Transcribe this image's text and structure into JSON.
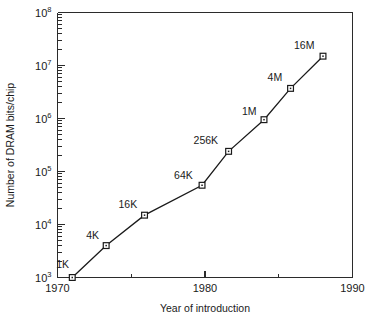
{
  "chart_data": {
    "type": "line",
    "title": "",
    "subtitle": "",
    "xlabel": "Year of introduction",
    "ylabel": "Number of DRAM bits/chip",
    "xlim": [
      1970,
      1990
    ],
    "ylim": [
      1000,
      100000000
    ],
    "yscale": "log",
    "xscale": "linear",
    "grid": false,
    "legend": "none",
    "x_ticks": [
      {
        "value": 1970,
        "label": "1970",
        "type": "major"
      },
      {
        "value": 1975,
        "label": "",
        "type": "minor"
      },
      {
        "value": 1980,
        "label": "1980",
        "type": "major"
      },
      {
        "value": 1985,
        "label": "",
        "type": "minor"
      },
      {
        "value": 1990,
        "label": "1990",
        "type": "major"
      }
    ],
    "y_ticks": [
      {
        "value": 1000,
        "mantissa": "10",
        "exponent": "3"
      },
      {
        "value": 10000,
        "mantissa": "10",
        "exponent": "4"
      },
      {
        "value": 100000,
        "mantissa": "10",
        "exponent": "5"
      },
      {
        "value": 1000000,
        "mantissa": "10",
        "exponent": "6"
      },
      {
        "value": 10000000,
        "mantissa": "10",
        "exponent": "7"
      },
      {
        "value": 100000000,
        "mantissa": "10",
        "exponent": "8"
      }
    ],
    "series": [
      {
        "name": "DRAM bits per chip",
        "marker": "open-square",
        "points": [
          {
            "label": "1K",
            "x": 1971.0,
            "y": 1000,
            "label_dx": -16,
            "label_dy": -10
          },
          {
            "label": "4K",
            "x": 1973.3,
            "y": 4000,
            "label_dx": -20,
            "label_dy": -7
          },
          {
            "label": "16K",
            "x": 1975.9,
            "y": 15000,
            "label_dx": -26,
            "label_dy": -7
          },
          {
            "label": "64K",
            "x": 1979.8,
            "y": 55000,
            "label_dx": -28,
            "label_dy": -6
          },
          {
            "label": "256K",
            "x": 1981.6,
            "y": 240000,
            "label_dx": -35,
            "label_dy": -7
          },
          {
            "label": "1M",
            "x": 1984.0,
            "y": 950000,
            "label_dx": -22,
            "label_dy": -5
          },
          {
            "label": "4M",
            "x": 1985.8,
            "y": 3700000,
            "label_dx": -23,
            "label_dy": -7
          },
          {
            "label": "16M",
            "x": 1988.0,
            "y": 15000000,
            "label_dx": -29,
            "label_dy": -7
          }
        ]
      }
    ]
  }
}
